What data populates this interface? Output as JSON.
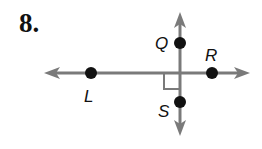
{
  "problem": {
    "number": "8."
  },
  "diagram": {
    "line_color": "#7a7a7a",
    "point_color": "#111111",
    "points": [
      {
        "label": "Q",
        "x": 180,
        "y": 43
      },
      {
        "label": "R",
        "x": 212,
        "y": 73
      },
      {
        "label": "L",
        "x": 91,
        "y": 73
      },
      {
        "label": "S",
        "x": 180,
        "y": 102
      }
    ],
    "lines": [
      {
        "name": "line-LR",
        "orientation": "horizontal",
        "arrows": "both"
      },
      {
        "name": "line-QS",
        "orientation": "vertical",
        "arrows": "both"
      }
    ],
    "right_angle_marker": true
  }
}
